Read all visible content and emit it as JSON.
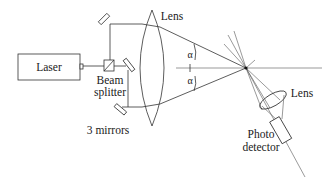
{
  "diagram": {
    "type": "optical-setup",
    "labels": {
      "laser": "Laser",
      "beam_splitter_line1": "Beam",
      "beam_splitter_line2": "splitter",
      "mirrors": "3 mirrors",
      "main_lens": "Lens",
      "detector_lens": "Lens",
      "photo_detector_line1": "Photo",
      "photo_detector_line2": "detector",
      "angle_top": "α",
      "angle_bottom": "α"
    },
    "components": [
      {
        "id": "laser",
        "label": "Laser"
      },
      {
        "id": "beam-splitter",
        "label": "Beam splitter"
      },
      {
        "id": "mirrors",
        "label": "3 mirrors",
        "count": 3
      },
      {
        "id": "main-lens",
        "label": "Lens"
      },
      {
        "id": "focal-point"
      },
      {
        "id": "detector-lens",
        "label": "Lens"
      },
      {
        "id": "photo-detector",
        "label": "Photo detector"
      }
    ],
    "angles": [
      "α",
      "α"
    ]
  }
}
